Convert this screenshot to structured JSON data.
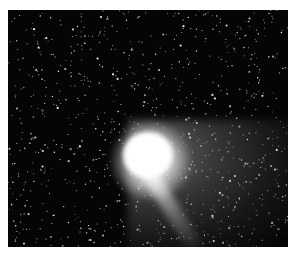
{
  "image": {
    "subject": "Comet with bright coma and tails against a dense star field",
    "background_color": "#050505",
    "border_color": "#ffffff",
    "elements": {
      "coma": {
        "description": "bright white comet head",
        "center": [
          148,
          148
        ]
      },
      "dust_tail": {
        "description": "diffuse fan-shaped tail extending to the right and lower-right"
      },
      "ion_tail": {
        "description": "narrow streak extending toward the lower right"
      },
      "star_field": {
        "description": "many small white and grey stars scattered across the frame"
      }
    }
  }
}
